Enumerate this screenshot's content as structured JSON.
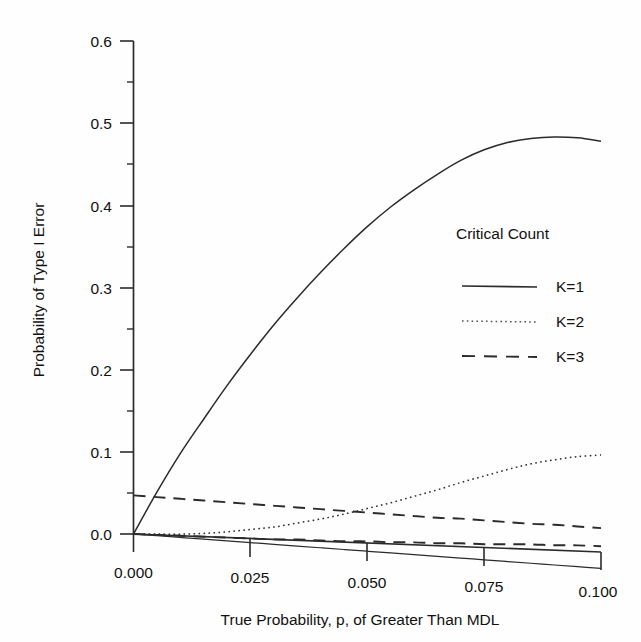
{
  "chart_data": {
    "type": "line",
    "title": "",
    "xlabel": "True Probability, p,  of Greater Than MDL",
    "ylabel": "Probability of Type I Error",
    "xlim": [
      0.0,
      0.1
    ],
    "ylim": [
      0.0,
      0.6
    ],
    "grid": false,
    "legend_position": "inside-right",
    "legend_title": "Critical Count",
    "xticks": [
      0.0,
      0.025,
      0.05,
      0.075,
      0.1
    ],
    "xtick_labels": [
      "0.000",
      "0.025",
      "0.050",
      "0.075",
      "0.100"
    ],
    "yticks": [
      0.0,
      0.1,
      0.2,
      0.3,
      0.4,
      0.5,
      0.6
    ],
    "ytick_labels": [
      "0.0",
      "0.1",
      "0.2",
      "0.3",
      "0.4",
      "0.5",
      "0.6"
    ],
    "yticks_minor": [
      0.05,
      0.15,
      0.25,
      0.35,
      0.45,
      0.55
    ],
    "x": [
      0.0,
      0.005,
      0.01,
      0.015,
      0.02,
      0.025,
      0.03,
      0.035,
      0.04,
      0.045,
      0.05,
      0.055,
      0.06,
      0.065,
      0.07,
      0.075,
      0.08,
      0.085,
      0.09,
      0.095,
      0.1
    ],
    "series": [
      {
        "name": "K=1",
        "style": "solid",
        "values": [
          0.0,
          0.052,
          0.1,
          0.143,
          0.185,
          0.224,
          0.261,
          0.295,
          0.327,
          0.357,
          0.385,
          0.41,
          0.432,
          0.452,
          0.47,
          0.484,
          0.494,
          0.5,
          0.503,
          0.503,
          0.5
        ]
      },
      {
        "name": "K=2",
        "style": "dotted",
        "values": [
          0.0,
          0.001,
          0.002,
          0.004,
          0.007,
          0.011,
          0.015,
          0.021,
          0.027,
          0.034,
          0.042,
          0.05,
          0.059,
          0.068,
          0.078,
          0.087,
          0.096,
          0.104,
          0.11,
          0.115,
          0.118
        ]
      },
      {
        "name": "K=3",
        "style": "dashed",
        "values": [
          0.047,
          0.046,
          0.045,
          0.044,
          0.043,
          0.042,
          0.041,
          0.04,
          0.039,
          0.038,
          0.037,
          0.036,
          0.035,
          0.034,
          0.034,
          0.033,
          0.032,
          0.031,
          0.031,
          0.03,
          0.029
        ]
      },
      {
        "name": "K=3-lower",
        "style": "dashed",
        "values": [
          0.0,
          0.0,
          0.0,
          0.0,
          0.0,
          0.0,
          0.0,
          0.001,
          0.001,
          0.001,
          0.002,
          0.002,
          0.003,
          0.003,
          0.004,
          0.004,
          0.005,
          0.006,
          0.006,
          0.007,
          0.007
        ]
      },
      {
        "name": "baseline",
        "style": "solid-thin",
        "values": [
          0.0,
          -0.001,
          -0.002,
          -0.003,
          -0.004,
          -0.005,
          -0.006,
          -0.007,
          -0.008,
          -0.009,
          -0.01,
          -0.011,
          -0.012,
          -0.013,
          -0.014,
          -0.015,
          -0.016,
          -0.017,
          -0.018,
          -0.019,
          -0.02
        ]
      }
    ],
    "legend_entries": [
      {
        "label": "K=1",
        "style": "solid"
      },
      {
        "label": "K=2",
        "style": "dotted"
      },
      {
        "label": "K=3",
        "style": "dashed"
      }
    ]
  }
}
